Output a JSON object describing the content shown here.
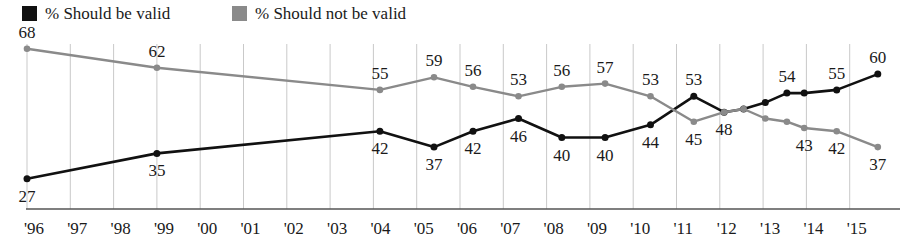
{
  "legend": {
    "entries": [
      {
        "label": "% Should be valid",
        "color": "#111111",
        "swatch": "legend-swatch-black",
        "x": 22
      },
      {
        "label": "% Should not be valid",
        "color": "#8a8a8a",
        "swatch": "legend-swatch-gray",
        "x": 232
      }
    ]
  },
  "axis": {
    "ticks": [
      "'96",
      "'97",
      "'98",
      "'99",
      "'00",
      "'01",
      "'02",
      "'03",
      "'04",
      "'05",
      "'06",
      "'07",
      "'08",
      "'09",
      "'10",
      "'11",
      "'12",
      "'13",
      "'14",
      "'15"
    ]
  },
  "colors": {
    "should_be_valid": "#111111",
    "should_not_be_valid": "#8a8a8a",
    "gridline": "#c9c9c9",
    "baseline": "#555555",
    "background": "#ffffff"
  },
  "chart_data": {
    "type": "line",
    "title": "",
    "subtitle": "",
    "xlabel": "",
    "ylabel": "",
    "grid": "vertical",
    "legend_position": "top-left",
    "ylim": [
      20,
      72
    ],
    "categories": [
      "'96",
      "'97",
      "'98",
      "'99",
      "'00",
      "'01",
      "'02",
      "'03",
      "'04",
      "'05",
      "'06",
      "'07",
      "'08",
      "'09",
      "'10",
      "'11",
      "'12",
      "'13",
      "'14",
      "'15"
    ],
    "series": [
      {
        "name": "% Should be valid",
        "color": "#111111",
        "points": [
          {
            "x": "'96",
            "xpos": 0.0,
            "value": 27,
            "label": "27",
            "label_pos": "below"
          },
          {
            "x": "'99",
            "xpos": 3.0,
            "value": 35,
            "label": "35",
            "label_pos": "below"
          },
          {
            "x": "'04",
            "xpos": 8.15,
            "value": 42,
            "label": "42",
            "label_pos": "below"
          },
          {
            "x": "'05",
            "xpos": 9.4,
            "value": 37,
            "label": "37",
            "label_pos": "below"
          },
          {
            "x": "'06",
            "xpos": 10.3,
            "value": 42,
            "label": "42",
            "label_pos": "below"
          },
          {
            "x": "'07",
            "xpos": 11.35,
            "value": 46,
            "label": "46",
            "label_pos": "below"
          },
          {
            "x": "'08",
            "xpos": 12.35,
            "value": 40,
            "label": "40",
            "label_pos": "below"
          },
          {
            "x": "'09",
            "xpos": 13.35,
            "value": 40,
            "label": "40",
            "label_pos": "below"
          },
          {
            "x": "'10",
            "xpos": 14.4,
            "value": 44,
            "label": "44",
            "label_pos": "below"
          },
          {
            "x": "'11",
            "xpos": 15.4,
            "value": 53,
            "label": "53",
            "label_pos": "above"
          },
          {
            "x": "'11.7",
            "xpos": 16.1,
            "value": 48,
            "label": "",
            "label_pos": "none"
          },
          {
            "x": "'12",
            "xpos": 16.55,
            "value": 49,
            "label": "",
            "label_pos": "none"
          },
          {
            "x": "'12.5",
            "xpos": 17.05,
            "value": 51,
            "label": "",
            "label_pos": "none"
          },
          {
            "x": "'13",
            "xpos": 17.55,
            "value": 54,
            "label": "54",
            "label_pos": "above"
          },
          {
            "x": "'13.4",
            "xpos": 17.95,
            "value": 54,
            "label": "",
            "label_pos": "none"
          },
          {
            "x": "'14",
            "xpos": 18.7,
            "value": 55,
            "label": "55",
            "label_pos": "above"
          },
          {
            "x": "'15",
            "xpos": 19.65,
            "value": 60,
            "label": "60",
            "label_pos": "above"
          }
        ]
      },
      {
        "name": "% Should not be valid",
        "color": "#8a8a8a",
        "points": [
          {
            "x": "'96",
            "xpos": 0.0,
            "value": 68,
            "label": "68",
            "label_pos": "above"
          },
          {
            "x": "'99",
            "xpos": 3.0,
            "value": 62,
            "label": "62",
            "label_pos": "above"
          },
          {
            "x": "'04",
            "xpos": 8.15,
            "value": 55,
            "label": "55",
            "label_pos": "above"
          },
          {
            "x": "'05",
            "xpos": 9.4,
            "value": 59,
            "label": "59",
            "label_pos": "above"
          },
          {
            "x": "'06",
            "xpos": 10.3,
            "value": 56,
            "label": "56",
            "label_pos": "above"
          },
          {
            "x": "'07",
            "xpos": 11.35,
            "value": 53,
            "label": "53",
            "label_pos": "above"
          },
          {
            "x": "'08",
            "xpos": 12.35,
            "value": 56,
            "label": "56",
            "label_pos": "above"
          },
          {
            "x": "'09",
            "xpos": 13.35,
            "value": 57,
            "label": "57",
            "label_pos": "above"
          },
          {
            "x": "'10",
            "xpos": 14.4,
            "value": 53,
            "label": "53",
            "label_pos": "above"
          },
          {
            "x": "'11",
            "xpos": 15.4,
            "value": 45,
            "label": "45",
            "label_pos": "below"
          },
          {
            "x": "'11.7",
            "xpos": 16.1,
            "value": 48,
            "label": "48",
            "label_pos": "below"
          },
          {
            "x": "'12",
            "xpos": 16.55,
            "value": 49,
            "label": "",
            "label_pos": "none"
          },
          {
            "x": "'12.5",
            "xpos": 17.05,
            "value": 46,
            "label": "",
            "label_pos": "none"
          },
          {
            "x": "'13",
            "xpos": 17.55,
            "value": 45,
            "label": "",
            "label_pos": "none"
          },
          {
            "x": "'13.4",
            "xpos": 17.95,
            "value": 43,
            "label": "43",
            "label_pos": "below"
          },
          {
            "x": "'14",
            "xpos": 18.7,
            "value": 42,
            "label": "42",
            "label_pos": "below"
          },
          {
            "x": "'15",
            "xpos": 19.65,
            "value": 37,
            "label": "37",
            "label_pos": "below"
          }
        ]
      }
    ]
  }
}
